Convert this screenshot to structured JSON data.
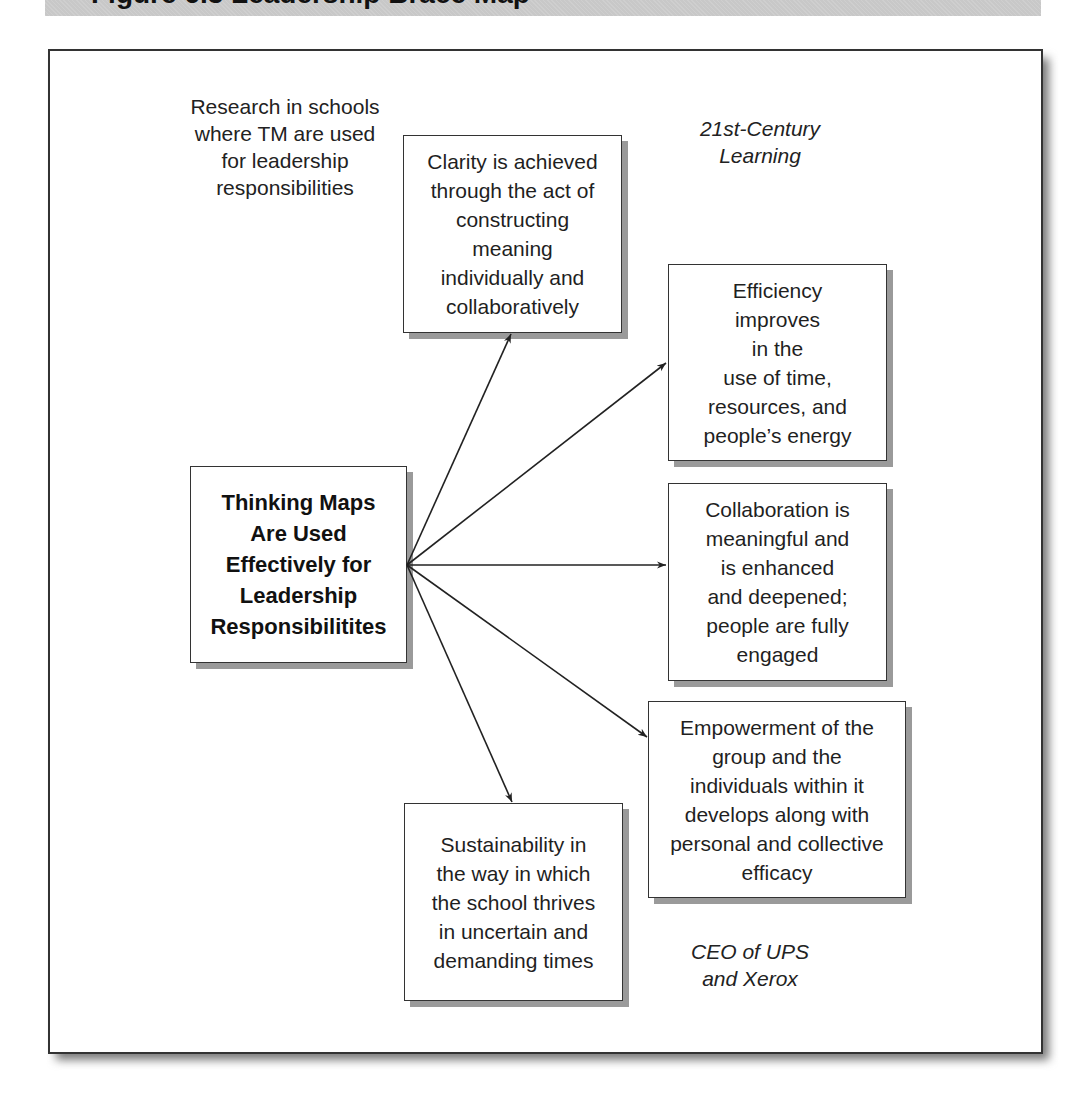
{
  "banner": {
    "title": "Figure 6.3   Leadership Brace Map",
    "color": "#c8c8c8"
  },
  "diagram": {
    "center_node": {
      "label": "Thinking Maps\nAre Used\nEffectively for\nLeadership\nResponsibilitites"
    },
    "annotations": {
      "top_left": "Research in schools\nwhere TM are used\nfor leadership\nresponsibilities",
      "top_right": "21st-Century\nLearning",
      "bottom_right": "CEO of UPS\nand Xerox"
    },
    "outcome_nodes": [
      {
        "id": "clarity",
        "label": "Clarity is achieved\nthrough the act of\nconstructing\nmeaning\nindividually and\ncollaboratively"
      },
      {
        "id": "efficiency",
        "label": "Efficiency\nimproves\nin the\nuse of time,\nresources, and\npeople’s energy"
      },
      {
        "id": "collaboration",
        "label": "Collaboration is\nmeaningful and\nis enhanced\nand deepened;\npeople are fully\nengaged"
      },
      {
        "id": "empowerment",
        "label": "Empowerment of the\ngroup and the\nindividuals within it\ndevelops along with\npersonal and collective\nefficacy"
      },
      {
        "id": "sustainability",
        "label": "Sustainability in\nthe way in which\nthe school thrives\nin uncertain and\ndemanding times"
      }
    ],
    "edges": [
      {
        "from": "center",
        "to": "clarity"
      },
      {
        "from": "center",
        "to": "efficiency"
      },
      {
        "from": "center",
        "to": "collaboration"
      },
      {
        "from": "center",
        "to": "empowerment"
      },
      {
        "from": "center",
        "to": "sustainability"
      }
    ],
    "colors": {
      "line": "#222222",
      "box_border": "#333333",
      "shadow": "#9a9a9a"
    }
  }
}
